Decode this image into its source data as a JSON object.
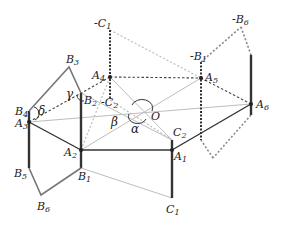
{
  "diagram": {
    "title": "",
    "points": {
      "A1": {
        "label": "A",
        "sub": "1",
        "x": 172,
        "y": 150,
        "lx": 174,
        "ly": 160
      },
      "A2": {
        "label": "A",
        "sub": "2",
        "x": 81,
        "y": 150,
        "lx": 64,
        "ly": 156
      },
      "A3": {
        "label": "A",
        "sub": "3",
        "x": 29,
        "y": 122,
        "lx": 16,
        "ly": 128
      },
      "A4": {
        "label": "A",
        "sub": "4",
        "x": 110,
        "y": 77,
        "lx": 92,
        "ly": 80
      },
      "A5": {
        "label": "A",
        "sub": "5",
        "x": 201,
        "y": 78,
        "lx": 205,
        "ly": 82
      },
      "A6": {
        "label": "A",
        "sub": "6",
        "x": 251,
        "y": 104,
        "lx": 256,
        "ly": 109
      },
      "O": {
        "label": "O",
        "sub": "",
        "x": 142,
        "y": 112,
        "lx": 151,
        "ly": 121
      },
      "B1": {
        "label": "B",
        "sub": "1",
        "x": 81,
        "y": 168,
        "lx": 78,
        "ly": 180
      },
      "B2": {
        "label": "B",
        "sub": "2",
        "x": 81,
        "y": 93,
        "lx": 84,
        "ly": 104
      },
      "B3": {
        "label": "B",
        "sub": "3",
        "x": 69,
        "y": 67,
        "lx": 66,
        "ly": 63
      },
      "B4": {
        "label": "B",
        "sub": "4",
        "x": 29,
        "y": 111,
        "lx": 15,
        "ly": 115
      },
      "B5": {
        "label": "B",
        "sub": "5",
        "x": 29,
        "y": 168,
        "lx": 14,
        "ly": 177
      },
      "B6": {
        "label": "B",
        "sub": "6",
        "x": 41,
        "y": 195,
        "lx": 38,
        "ly": 210
      },
      "C1": {
        "label": "C",
        "sub": "1",
        "x": 172,
        "y": 198,
        "lx": 166,
        "ly": 213
      },
      "C2": {
        "label": "C",
        "sub": "2",
        "x": 172,
        "y": 140,
        "lx": 173,
        "ly": 137
      },
      "nC1": {
        "label": "-C",
        "sub": "1",
        "x": 110,
        "y": 30,
        "lx": 95,
        "ly": 27
      },
      "nC2": {
        "label": "-C",
        "sub": "2",
        "x": 110,
        "y": 100,
        "lx": 100,
        "ly": 106
      },
      "nB1": {
        "label": "-B",
        "sub": "1",
        "x": 201,
        "y": 62,
        "lx": 190,
        "ly": 60
      },
      "nB6": {
        "label": "-B",
        "sub": "6",
        "x": 241,
        "y": 27,
        "lx": 232,
        "ly": 24
      }
    },
    "angles": [
      {
        "symbol": "α",
        "x": 132,
        "y": 131
      },
      {
        "symbol": "β",
        "x": 112,
        "y": 124
      },
      {
        "symbol": "γ",
        "x": 65,
        "y": 96
      },
      {
        "symbol": "δ",
        "x": 38,
        "y": 112
      }
    ],
    "colors": {
      "dark": "#333333",
      "mid": "#777777",
      "light": "#bbbbbb"
    }
  }
}
